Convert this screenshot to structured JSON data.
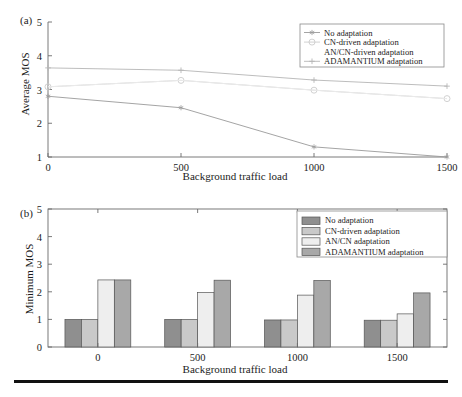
{
  "figure": {
    "panel_a_label": "(a)",
    "panel_b_label": "(b)",
    "has_bottom_rule": true,
    "colors": {
      "series_no_adaptation": "#8f8f8f",
      "series_cn_driven": "#c9c9c9",
      "series_an_cn": "#e8e8e8",
      "series_adamantium": "#a8a8a8",
      "axis": "#6b6b6b",
      "text": "#1c1c1c",
      "rule": "#111111"
    }
  },
  "chart_data": [
    {
      "type": "line",
      "panel": "(a)",
      "title": "",
      "xlabel": "Background traffic load",
      "ylabel": "Average MOS",
      "x": [
        0,
        500,
        1000,
        1500
      ],
      "xticks": [
        "0",
        "500",
        "1000",
        "1500"
      ],
      "yticks": [
        "1",
        "2",
        "3",
        "4",
        "5"
      ],
      "xlim": [
        0,
        1500
      ],
      "ylim": [
        1,
        5
      ],
      "grid": false,
      "legend_position": "top-right",
      "series": [
        {
          "name": "No adaptation",
          "marker": "asterisk",
          "color": "#9a9a9a",
          "values": [
            2.8,
            2.46,
            1.3,
            1.0
          ]
        },
        {
          "name": "CN-driven adaptation",
          "marker": "circle-open",
          "color": "#cccccc",
          "values": [
            3.08,
            3.27,
            2.98,
            2.73
          ]
        },
        {
          "name": "AN/CN-driven adaptation",
          "marker": "none",
          "color": "#ededed",
          "values": [
            3.08,
            3.27,
            2.98,
            2.73
          ]
        },
        {
          "name": "ADAMANTIUM adaptation",
          "marker": "cross",
          "color": "#b5b5b5",
          "values": [
            3.64,
            3.57,
            3.28,
            3.1
          ]
        }
      ]
    },
    {
      "type": "bar",
      "panel": "(b)",
      "title": "",
      "xlabel": "Background traffic load",
      "ylabel": "Minimum MOS",
      "categories": [
        "0",
        "500",
        "1000",
        "1500"
      ],
      "yticks": [
        "0",
        "1",
        "2",
        "3",
        "4",
        "5"
      ],
      "ylim": [
        0,
        5
      ],
      "grid": false,
      "legend_position": "top-right",
      "series": [
        {
          "name": "No adaptation",
          "color": "#8f8f8f",
          "values": [
            1.0,
            1.0,
            0.98,
            0.97
          ]
        },
        {
          "name": "CN-driven adaptation",
          "color": "#c9c9c9",
          "values": [
            1.0,
            1.0,
            0.98,
            0.97
          ]
        },
        {
          "name": "AN/CN adaptation",
          "color": "#eeeeee",
          "values": [
            2.43,
            1.97,
            1.88,
            1.2
          ]
        },
        {
          "name": "ADAMANTIUM adaptation",
          "color": "#a8a8a8",
          "values": [
            2.43,
            2.42,
            2.41,
            1.96
          ]
        }
      ]
    }
  ]
}
